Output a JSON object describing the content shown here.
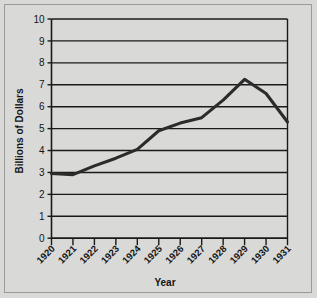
{
  "chart_data": {
    "type": "line",
    "title": "",
    "xlabel": "Year",
    "ylabel": "Billions of Dollars",
    "x": [
      1920,
      1921,
      1922,
      1923,
      1924,
      1925,
      1926,
      1927,
      1928,
      1929,
      1930,
      1931
    ],
    "categories": [
      "1920",
      "1921",
      "1922",
      "1923",
      "1924",
      "1925",
      "1926",
      "1927",
      "1928",
      "1929",
      "1930",
      "1931"
    ],
    "values": [
      2.95,
      2.9,
      3.3,
      3.65,
      4.05,
      4.9,
      5.25,
      5.5,
      6.3,
      7.25,
      6.6,
      5.3
    ],
    "series": [
      {
        "name": "Billions of Dollars",
        "values": [
          2.95,
          2.9,
          3.3,
          3.65,
          4.05,
          4.9,
          5.25,
          5.5,
          6.3,
          7.25,
          6.6,
          5.3
        ]
      }
    ],
    "ylim": [
      0,
      10
    ],
    "yticks": [
      0,
      1,
      2,
      3,
      4,
      5,
      6,
      7,
      8,
      9,
      10
    ],
    "ytick_labels": [
      "0",
      "1",
      "2",
      "3",
      "4",
      "5",
      "6",
      "7",
      "8",
      "9",
      "10"
    ],
    "xtick_labels": [
      "1920",
      "1921",
      "1922",
      "1923",
      "1924",
      "1925",
      "1926",
      "1927",
      "1928",
      "1929",
      "1930",
      "1931"
    ],
    "grid": true,
    "grid_axis": "y",
    "legend": false,
    "legend_position": "none",
    "line_color": "#2b2b2b",
    "plot_background": "#d9d9d7",
    "figure_background": "#d9d9d7",
    "axis_color": "#1a1a1a",
    "text_color": "#141414",
    "xtick_label_rotation": 45,
    "annotations": []
  },
  "axis_titles": {
    "y": "Billions of Dollars",
    "x": "Year"
  }
}
